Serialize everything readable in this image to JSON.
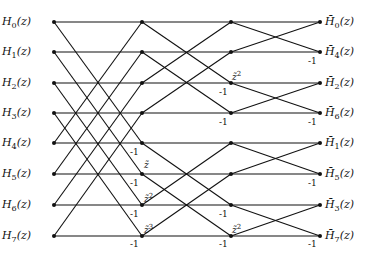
{
  "diagram": {
    "type": "butterfly-signal-flow",
    "stages_x": [
      54,
      142,
      231,
      320
    ],
    "rows_y": [
      22,
      52,
      83,
      113,
      143,
      174,
      205,
      236
    ],
    "line_color": "#111111",
    "inputs": [
      {
        "base": "H",
        "sub": "0",
        "tail": "(z)"
      },
      {
        "base": "H",
        "sub": "1",
        "tail": "(z)"
      },
      {
        "base": "H",
        "sub": "2",
        "tail": "(z)"
      },
      {
        "base": "H",
        "sub": "3",
        "tail": "(z)"
      },
      {
        "base": "H",
        "sub": "4",
        "tail": "(z)"
      },
      {
        "base": "H",
        "sub": "5",
        "tail": "(z)"
      },
      {
        "base": "H",
        "sub": "6",
        "tail": "(z)"
      },
      {
        "base": "H",
        "sub": "7",
        "tail": "(z)"
      }
    ],
    "outputs": [
      {
        "base": "H̄",
        "sub": "0",
        "tail": "(z)"
      },
      {
        "base": "H̄",
        "sub": "4",
        "tail": "(z)"
      },
      {
        "base": "H̄",
        "sub": "2",
        "tail": "(z)"
      },
      {
        "base": "H̄",
        "sub": "6",
        "tail": "(z)"
      },
      {
        "base": "H̄",
        "sub": "1",
        "tail": "(z)"
      },
      {
        "base": "H̄",
        "sub": "5",
        "tail": "(z)"
      },
      {
        "base": "H̄",
        "sub": "3",
        "tail": "(z)"
      },
      {
        "base": "H̄",
        "sub": "7",
        "tail": "(z)"
      }
    ],
    "stage1": {
      "minus_one_label": "-1",
      "minus_one_rows": [
        4,
        5,
        6,
        7
      ],
      "twiddles": [
        {
          "row": 5,
          "base": "z̃",
          "exp": ""
        },
        {
          "row": 6,
          "base": "z̃",
          "exp": "2"
        },
        {
          "row": 7,
          "base": "z̃",
          "exp": "3"
        }
      ]
    },
    "stage2": {
      "minus_one_label": "-1",
      "minus_one_rows": [
        2,
        3,
        6,
        7
      ],
      "twiddles": [
        {
          "row": 2,
          "base": "z̃",
          "exp": "2"
        },
        {
          "row": 7,
          "base": "z̃",
          "exp": "2"
        }
      ]
    },
    "stage3": {
      "minus_one_label": "-1",
      "minus_one_rows": [
        1,
        3,
        5,
        7
      ]
    }
  }
}
